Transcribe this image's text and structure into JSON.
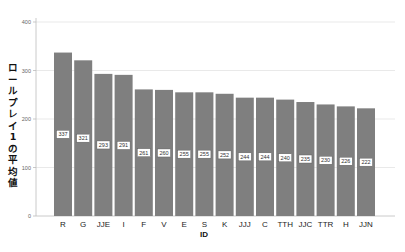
{
  "chart_data": {
    "type": "bar",
    "title": "",
    "xlabel": "ID",
    "ylabel": "ロールプレイ1の平均値",
    "ylim": [
      0,
      400
    ],
    "yticks": [
      0,
      100,
      200,
      300,
      400
    ],
    "grid": true,
    "legend": null,
    "categories": [
      "R",
      "G",
      "JJE",
      "I",
      "F",
      "V",
      "E",
      "S",
      "K",
      "JJJ",
      "C",
      "TTH",
      "JJC",
      "TTR",
      "H",
      "JJN"
    ],
    "values": [
      337,
      321,
      293,
      291,
      261,
      260,
      255,
      255,
      252,
      244,
      244,
      240,
      235,
      230,
      226,
      222
    ],
    "data_labels": true,
    "bar_color": "#7f7f7f"
  },
  "axis": {
    "ylabel_chars": [
      "ロ",
      "ー",
      "ル",
      "プ",
      "レ",
      "イ",
      "1",
      "の",
      "平",
      "均",
      "値"
    ],
    "xlabel": "ID"
  }
}
